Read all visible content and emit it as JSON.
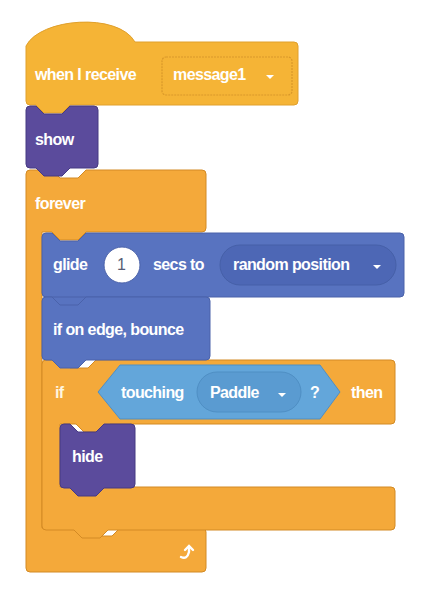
{
  "colors": {
    "events": "#F5B436",
    "events_dark": "#D9982A",
    "control": "#F4A93A",
    "control_dark": "#D38A24",
    "looks": "#5B4B9C",
    "looks_dark": "#473A82",
    "motion": "#5873C0",
    "motion_dark": "#4A62AA",
    "sensing": "#63A6DA",
    "sensing_dark": "#4F8FC4",
    "text": "#ffffff"
  },
  "script": {
    "hat": {
      "label": "when I receive",
      "dropdown": {
        "value": "message1",
        "icon": "caret-down-icon"
      }
    },
    "show": {
      "label": "show"
    },
    "forever": {
      "label": "forever",
      "loop_icon": "loop-arrow-icon"
    },
    "glide": {
      "label_before": "glide",
      "secs_value": "1",
      "label_after": "secs to",
      "dropdown": {
        "value": "random position",
        "icon": "caret-down-icon"
      }
    },
    "bounce": {
      "label": "if on edge, bounce"
    },
    "if_block": {
      "label_if": "if",
      "condition": {
        "label": "touching",
        "dropdown": {
          "value": "Paddle",
          "icon": "caret-down-icon"
        },
        "suffix": "?"
      },
      "label_then": "then"
    },
    "hide": {
      "label": "hide"
    }
  }
}
